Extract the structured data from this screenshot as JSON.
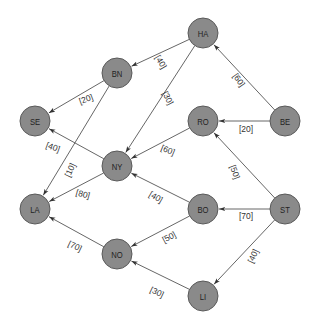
{
  "diagram": {
    "type": "directed-weighted-graph",
    "nodes": [
      {
        "id": "HA",
        "label": "HA",
        "x": 203,
        "y": 33
      },
      {
        "id": "BN",
        "label": "BN",
        "x": 117,
        "y": 73
      },
      {
        "id": "SE",
        "label": "SE",
        "x": 35,
        "y": 121
      },
      {
        "id": "RO",
        "label": "RO",
        "x": 203,
        "y": 121
      },
      {
        "id": "BE",
        "label": "BE",
        "x": 285,
        "y": 121
      },
      {
        "id": "NY",
        "label": "NY",
        "x": 117,
        "y": 166
      },
      {
        "id": "LA",
        "label": "LA",
        "x": 35,
        "y": 209
      },
      {
        "id": "BO",
        "label": "BO",
        "x": 203,
        "y": 209
      },
      {
        "id": "ST",
        "label": "ST",
        "x": 285,
        "y": 209
      },
      {
        "id": "NO",
        "label": "NO",
        "x": 117,
        "y": 254
      },
      {
        "id": "LI",
        "label": "LI",
        "x": 203,
        "y": 296
      }
    ],
    "edges": [
      {
        "from": "HA",
        "to": "BN",
        "weight": "[40]",
        "lx": 161,
        "ly": 62,
        "rot": 60
      },
      {
        "from": "HA",
        "to": "NY",
        "weight": "[30]",
        "lx": 168,
        "ly": 98,
        "rot": 62
      },
      {
        "from": "BE",
        "to": "HA",
        "weight": "[60]",
        "lx": 239,
        "ly": 80,
        "rot": 55
      },
      {
        "from": "BE",
        "to": "RO",
        "weight": "[20]",
        "lx": 246,
        "ly": 129,
        "rot": 0
      },
      {
        "from": "BN",
        "to": "SE",
        "weight": "[20]",
        "lx": 86,
        "ly": 99,
        "rot": -20
      },
      {
        "from": "BN",
        "to": "LA",
        "weight": "[10]",
        "lx": 70,
        "ly": 170,
        "rot": -65
      },
      {
        "from": "NY",
        "to": "SE",
        "weight": "[40]",
        "lx": 53,
        "ly": 147,
        "rot": 20
      },
      {
        "from": "RO",
        "to": "NY",
        "weight": "[60]",
        "lx": 168,
        "ly": 150,
        "rot": 22
      },
      {
        "from": "NY",
        "to": "LA",
        "weight": "[80]",
        "lx": 83,
        "ly": 194,
        "rot": 15
      },
      {
        "from": "BO",
        "to": "NY",
        "weight": "[40]",
        "lx": 156,
        "ly": 197,
        "rot": 30
      },
      {
        "from": "ST",
        "to": "RO",
        "weight": "[50]",
        "lx": 235,
        "ly": 172,
        "rot": 70
      },
      {
        "from": "ST",
        "to": "BO",
        "weight": "[70]",
        "lx": 246,
        "ly": 216,
        "rot": 0
      },
      {
        "from": "BO",
        "to": "NO",
        "weight": "[50]",
        "lx": 169,
        "ly": 237,
        "rot": -28
      },
      {
        "from": "NO",
        "to": "LA",
        "weight": "[70]",
        "lx": 75,
        "ly": 246,
        "rot": 25
      },
      {
        "from": "ST",
        "to": "LI",
        "weight": "[40]",
        "lx": 253,
        "ly": 256,
        "rot": -65
      },
      {
        "from": "LI",
        "to": "NO",
        "weight": "[30]",
        "lx": 157,
        "ly": 292,
        "rot": 25
      }
    ],
    "colors": {
      "node_fill": "#8a8a8a",
      "node_stroke": "#5a5a5a",
      "edge": "#555555",
      "background": "#ffffff"
    }
  }
}
